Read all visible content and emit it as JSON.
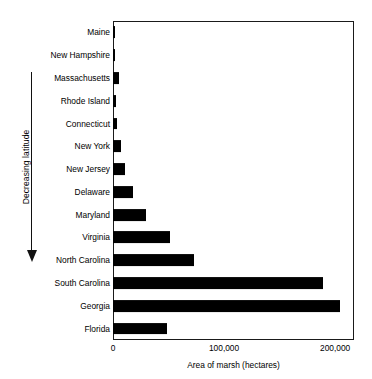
{
  "chart_data": {
    "type": "bar",
    "orientation": "horizontal",
    "title": "",
    "xlabel": "Area of marsh (hectares)",
    "ylabel": "",
    "categories": [
      "Maine",
      "New Hampshire",
      "Massachusetts",
      "Rhode Island",
      "Connecticut",
      "New York",
      "New Jersey",
      "Delaware",
      "Maryland",
      "Virginia",
      "North Carolina",
      "South Carolina",
      "Georgia",
      "Florida"
    ],
    "values": [
      2000,
      2000,
      5000,
      2500,
      4000,
      7000,
      11000,
      18000,
      30000,
      51000,
      73000,
      189000,
      204000,
      49000
    ],
    "xlim": [
      0,
      217000
    ],
    "xticks": [
      0,
      100000,
      200000
    ],
    "xticklabels": [
      "0",
      "100,000",
      "200,000"
    ],
    "grid": false,
    "legend": null,
    "bar_color": "#000000",
    "annotation": {
      "label": "Decreasing latitude",
      "direction": "down"
    }
  },
  "axis": {
    "x_title": "Area of marsh (hectares)",
    "tick_labels": [
      "0",
      "100,000",
      "200,000"
    ]
  },
  "annotation": {
    "latitude_label": "Decreasing latitude"
  },
  "colors": {
    "bar": "#000000",
    "frame": "#1a1a1a",
    "background": "#ffffff"
  }
}
